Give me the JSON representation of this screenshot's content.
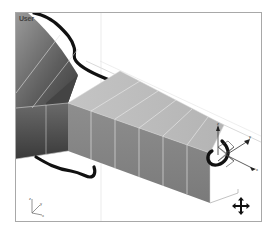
{
  "viewport": {
    "label": "User",
    "mode": "perspective-user-view",
    "background": "#ffffff",
    "border_color": "#a8a8a8"
  },
  "scene": {
    "object": "extruded-box-with-flared-end",
    "segments_visible": 6,
    "colors": {
      "top_face": "#bcbcbc",
      "side_face": "#8a8a8a",
      "flare_dark": "#5a5a5a",
      "edge_lines": "#e6e6e6",
      "spline": "#111111"
    }
  },
  "gizmo": {
    "type": "move-transform-gizmo",
    "axes": [
      "z",
      "y",
      "x"
    ]
  },
  "axis_tripod": {
    "axes": [
      "z",
      "y",
      "x"
    ]
  },
  "cursor": {
    "type": "pan-move-cursor"
  }
}
